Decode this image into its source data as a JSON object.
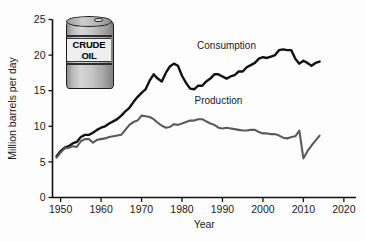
{
  "figure": {
    "background_color": "#fdfdfd",
    "caption": ""
  },
  "illustration": {
    "name": "crude-oil-barrel",
    "label_line_1": "CRUDE",
    "label_line_2": "OIL"
  },
  "chart_data": {
    "type": "line",
    "title": "",
    "xlabel": "Year",
    "ylabel": "Million barrels per day",
    "xlim": [
      1948,
      2023
    ],
    "ylim": [
      0,
      25
    ],
    "xticks": [
      1950,
      1960,
      1970,
      1980,
      1990,
      2000,
      2010,
      2020
    ],
    "xtick_labels": [
      "1950",
      "1960",
      "1970",
      "1980",
      "1990",
      "2000",
      "2010",
      "2020"
    ],
    "yticks": [
      0,
      5,
      10,
      15,
      20,
      25
    ],
    "ytick_labels": [
      "0",
      "5",
      "10",
      "15",
      "20",
      "25"
    ],
    "grid": false,
    "legend": "inline-annotations",
    "annotations": [
      {
        "text": "Consumption",
        "x": 1991,
        "y": 20.9
      },
      {
        "text": "Production",
        "x": 1989,
        "y": 13.1
      }
    ],
    "series": [
      {
        "name": "Consumption",
        "color": "#111111",
        "x": [
          1949,
          1950,
          1951,
          1952,
          1953,
          1954,
          1955,
          1956,
          1957,
          1958,
          1959,
          1960,
          1961,
          1962,
          1963,
          1964,
          1965,
          1966,
          1967,
          1968,
          1969,
          1970,
          1971,
          1972,
          1973,
          1974,
          1975,
          1976,
          1977,
          1978,
          1979,
          1980,
          1981,
          1982,
          1983,
          1984,
          1985,
          1986,
          1987,
          1988,
          1989,
          1990,
          1991,
          1992,
          1993,
          1994,
          1995,
          1996,
          1997,
          1998,
          1999,
          2000,
          2001,
          2002,
          2003,
          2004,
          2005,
          2006,
          2007,
          2008,
          2009,
          2010,
          2011,
          2012,
          2013,
          2014
        ],
        "y": [
          5.8,
          6.5,
          7.0,
          7.2,
          7.6,
          7.8,
          8.5,
          8.8,
          8.8,
          9.1,
          9.5,
          9.8,
          10.0,
          10.4,
          10.7,
          11.0,
          11.5,
          12.1,
          12.6,
          13.4,
          14.1,
          14.7,
          15.2,
          16.4,
          17.3,
          16.7,
          16.3,
          17.5,
          18.4,
          18.8,
          18.5,
          17.1,
          16.1,
          15.3,
          15.2,
          15.7,
          15.7,
          16.3,
          16.7,
          17.3,
          17.3,
          17.0,
          16.7,
          17.0,
          17.2,
          17.7,
          17.7,
          18.3,
          18.6,
          18.9,
          19.5,
          19.7,
          19.6,
          19.8,
          20.0,
          20.7,
          20.8,
          20.7,
          20.7,
          19.5,
          18.8,
          19.2,
          18.9,
          18.5,
          18.9,
          19.1
        ]
      },
      {
        "name": "Production",
        "color": "#5a5a5a",
        "x": [
          1949,
          1950,
          1951,
          1952,
          1953,
          1954,
          1955,
          1956,
          1957,
          1958,
          1959,
          1960,
          1961,
          1962,
          1963,
          1964,
          1965,
          1966,
          1967,
          1968,
          1969,
          1970,
          1971,
          1972,
          1973,
          1974,
          1975,
          1976,
          1977,
          1978,
          1979,
          1980,
          1981,
          1982,
          1983,
          1984,
          1985,
          1986,
          1987,
          1988,
          1989,
          1990,
          1991,
          1992,
          1993,
          1994,
          1995,
          1996,
          1997,
          1998,
          1999,
          2000,
          2001,
          2002,
          2003,
          2004,
          2005,
          2006,
          2007,
          2008,
          2009,
          2010,
          2011,
          2012,
          2013,
          2014
        ],
        "y": [
          5.6,
          6.3,
          6.9,
          7.0,
          7.2,
          7.1,
          7.9,
          8.2,
          8.2,
          7.7,
          8.1,
          8.2,
          8.3,
          8.5,
          8.6,
          8.7,
          8.8,
          9.5,
          10.2,
          10.6,
          10.8,
          11.5,
          11.4,
          11.3,
          11.0,
          10.5,
          10.1,
          9.8,
          9.9,
          10.3,
          10.2,
          10.4,
          10.6,
          10.8,
          10.8,
          11.0,
          11.0,
          10.7,
          10.4,
          10.2,
          9.8,
          9.7,
          9.8,
          9.7,
          9.6,
          9.5,
          9.4,
          9.4,
          9.5,
          9.5,
          9.2,
          9.0,
          9.0,
          8.9,
          8.9,
          8.7,
          8.4,
          8.3,
          8.5,
          8.6,
          9.4,
          5.5,
          6.5,
          7.3,
          8.0,
          8.7
        ]
      }
    ]
  }
}
